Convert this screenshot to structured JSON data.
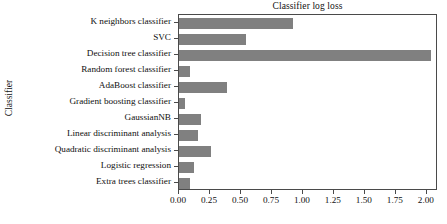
{
  "chart_data": {
    "type": "bar",
    "orientation": "horizontal",
    "title": "Classifier log loss",
    "xlabel": "",
    "ylabel": "Classifier",
    "categories": [
      "K neighbors classifier",
      "SVC",
      "Decision tree classifier",
      "Random forest classifier",
      "AdaBoost classifier",
      "Gradient boosting classifier",
      "GaussianNB",
      "Linear discriminant analysis",
      "Quadratic discriminant analysis",
      "Logistic regression",
      "Extra trees classifier"
    ],
    "values": [
      0.92,
      0.54,
      2.03,
      0.09,
      0.39,
      0.05,
      0.18,
      0.155,
      0.26,
      0.12,
      0.09
    ],
    "xlim": [
      0.0,
      2.09
    ],
    "xticks": [
      0.0,
      0.25,
      0.5,
      0.75,
      1.0,
      1.25,
      1.5,
      1.75,
      2.0
    ],
    "xtick_labels": [
      "0.00",
      "0.25",
      "0.50",
      "0.75",
      "1.00",
      "1.25",
      "1.50",
      "1.75",
      "2.00"
    ],
    "grid": false,
    "legend": false,
    "bar_color": "#808080",
    "axis_color": "#4a4a4a",
    "background_color": "#ffffff"
  }
}
